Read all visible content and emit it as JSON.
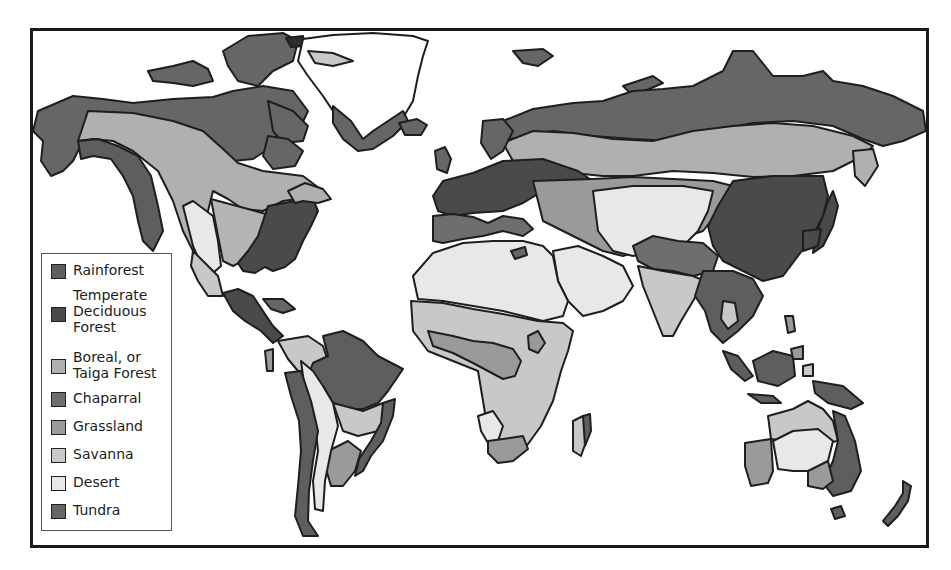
{
  "map": {
    "title": "World Biomes",
    "colors": {
      "ocean": "#ffffff",
      "outline": "#1e1e1e",
      "rainforest": "#5e5e5e",
      "temperate_deciduous": "#4a4a4a",
      "boreal": "#b0b0b0",
      "chaparral": "#6e6e6e",
      "grassland": "#9a9a9a",
      "savanna": "#c8c8c8",
      "desert": "#e8e8e8",
      "tundra": "#666666",
      "ice": "#ffffff"
    }
  },
  "legend": {
    "items": [
      {
        "key": "rainforest",
        "label": "Rainforest",
        "color": "#5e5e5e"
      },
      {
        "key": "temperate_deciduous",
        "label": "Temperate\nDeciduous\nForest",
        "color": "#4a4a4a"
      },
      {
        "key": "boreal",
        "label": "Boreal, or\nTaiga Forest",
        "color": "#b0b0b0"
      },
      {
        "key": "chaparral",
        "label": "Chaparral",
        "color": "#6e6e6e"
      },
      {
        "key": "grassland",
        "label": "Grassland",
        "color": "#9a9a9a"
      },
      {
        "key": "savanna",
        "label": "Savanna",
        "color": "#c8c8c8"
      },
      {
        "key": "desert",
        "label": "Desert",
        "color": "#e8e8e8"
      },
      {
        "key": "tundra",
        "label": "Tundra",
        "color": "#666666"
      }
    ]
  }
}
